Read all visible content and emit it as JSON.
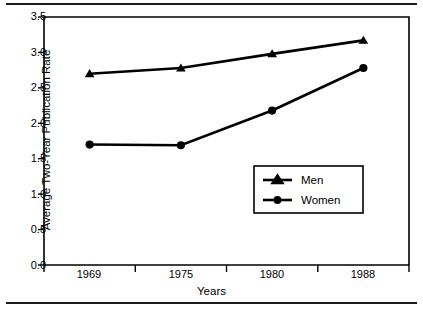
{
  "chart_data": {
    "type": "line",
    "title": "",
    "xlabel": "Years",
    "ylabel": "Average Two-Year Publication Rate",
    "categories": [
      "1969",
      "1975",
      "1980",
      "1988"
    ],
    "x": [
      1969,
      1975,
      1980,
      1988
    ],
    "series": [
      {
        "name": "Men",
        "marker": "triangle",
        "values": [
          2.7,
          2.78,
          2.98,
          3.17
        ]
      },
      {
        "name": "Women",
        "marker": "circle",
        "values": [
          1.7,
          1.69,
          2.18,
          2.78
        ]
      }
    ],
    "ylim": [
      0.0,
      3.5
    ],
    "yticks": [
      "0.0",
      "0.5",
      "1.0",
      "1.5",
      "2.0",
      "2.5",
      "3.0",
      "3.5"
    ],
    "ytick_values": [
      0.0,
      0.5,
      1.0,
      1.5,
      2.0,
      2.5,
      3.0,
      3.5
    ],
    "grid": false,
    "legend_position": "inside-lower-right",
    "line_color": "#000000",
    "background_color": "#ffffff"
  },
  "axes": {
    "y_labels": {
      "t0": "3.5",
      "t1": "3.0",
      "t2": "2.5",
      "t3": "2.0",
      "t4": "1.5",
      "t5": "1.0",
      "t6": "0.5",
      "t7": "0.0"
    },
    "x_labels": {
      "c0": "1969",
      "c1": "1975",
      "c2": "1980",
      "c3": "1988"
    },
    "y_title": "Average Two-Year Publication Rate",
    "x_title": "Years"
  },
  "legend": {
    "entries": {
      "men": "Men",
      "women": "Women"
    }
  }
}
